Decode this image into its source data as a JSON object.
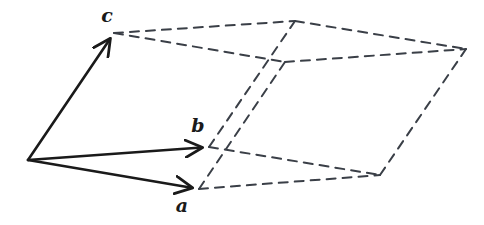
{
  "figure": {
    "background_color": "#ffffff",
    "solid_color": "#1a1a1a",
    "dashed_color": "#3a3f47",
    "solid_stroke_width": 2.6,
    "dashed_stroke_width": 2.0,
    "dash_pattern": "9 7"
  },
  "labels": {
    "a": "a",
    "b": "b",
    "c": "c"
  },
  "label_positions": {
    "a": {
      "x": 182,
      "y": 212
    },
    "b": {
      "x": 198,
      "y": 132
    },
    "c": {
      "x": 107,
      "y": 22
    }
  },
  "geometry": {
    "origin": {
      "x": 28,
      "y": 160
    },
    "a_tip": {
      "x": 199,
      "y": 189
    },
    "b_tip": {
      "x": 209,
      "y": 147
    },
    "c_tip": {
      "x": 114,
      "y": 33
    },
    "a_plus_b": {
      "x": 380,
      "y": 175
    },
    "a_plus_c": {
      "x": 285,
      "y": 62
    },
    "b_plus_c": {
      "x": 295,
      "y": 21
    },
    "a_plus_b_plus_c": {
      "x": 466,
      "y": 49
    }
  },
  "edges_dashed": [
    {
      "name": "edge-c-to-ac",
      "from": "c_tip",
      "to": "a_plus_c"
    },
    {
      "name": "edge-c-to-bc",
      "from": "c_tip",
      "to": "b_plus_c"
    },
    {
      "name": "edge-bc-to-abc",
      "from": "b_plus_c",
      "to": "a_plus_b_plus_c"
    },
    {
      "name": "edge-ac-to-abc",
      "from": "a_plus_c",
      "to": "a_plus_b_plus_c"
    },
    {
      "name": "edge-a-to-ac",
      "from": "a_tip",
      "to": "a_plus_c"
    },
    {
      "name": "edge-b-to-bc",
      "from": "b_tip",
      "to": "b_plus_c"
    },
    {
      "name": "edge-ab-to-abc",
      "from": "a_plus_b",
      "to": "a_plus_b_plus_c"
    },
    {
      "name": "edge-a-to-ab",
      "from": "a_tip",
      "to": "a_plus_b"
    },
    {
      "name": "edge-b-to-ab",
      "from": "b_tip",
      "to": "a_plus_b"
    }
  ],
  "vectors_solid": [
    {
      "name": "vector-a",
      "from": "origin",
      "to": "a_tip",
      "label": "a"
    },
    {
      "name": "vector-b",
      "from": "origin",
      "to": "b_tip",
      "label": "b"
    },
    {
      "name": "vector-c",
      "from": "origin",
      "to": "c_tip",
      "label": "c"
    }
  ],
  "chart_data": {
    "type": "diagram",
    "vectors": [
      {
        "name": "a",
        "origin": [
          28,
          160
        ],
        "tip": [
          199,
          189
        ],
        "components": [
          171,
          29
        ]
      },
      {
        "name": "b",
        "origin": [
          28,
          160
        ],
        "tip": [
          209,
          147
        ],
        "components": [
          181,
          -13
        ]
      },
      {
        "name": "c",
        "origin": [
          28,
          160
        ],
        "tip": [
          114,
          33
        ],
        "components": [
          86,
          -127
        ]
      }
    ],
    "derived_vertices": [
      {
        "name": "a+b",
        "point": [
          380,
          175
        ]
      },
      {
        "name": "a+c",
        "point": [
          285,
          62
        ]
      },
      {
        "name": "b+c",
        "point": [
          295,
          21
        ]
      },
      {
        "name": "a+b+c",
        "point": [
          466,
          49
        ]
      }
    ],
    "legend": [],
    "grid": false
  }
}
